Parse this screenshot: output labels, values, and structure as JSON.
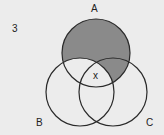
{
  "diagram": {
    "question_number": "3",
    "sets": [
      {
        "name": "A",
        "cx": 96,
        "cy": 53,
        "r": 34
      },
      {
        "name": "B",
        "cx": 80,
        "cy": 92,
        "r": 34
      },
      {
        "name": "C",
        "cx": 113,
        "cy": 92,
        "r": 34
      }
    ],
    "region_marker": "x",
    "shaded_region": "A minus B",
    "shade_color": "#8a8a8a",
    "stroke_color": "#2a2a2a",
    "background": "#ececec"
  }
}
